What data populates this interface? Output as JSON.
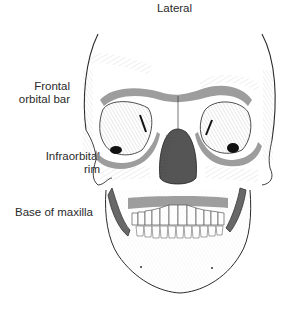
{
  "figure": {
    "title": "Lateral",
    "labels": [
      {
        "id": "frontal",
        "lines": [
          "Frontal",
          "orbital bar"
        ]
      },
      {
        "id": "infraorbital",
        "lines": [
          "Infraorbital",
          "rim"
        ]
      },
      {
        "id": "maxilla",
        "lines": [
          "Base of maxilla"
        ]
      }
    ],
    "colors": {
      "line": "#2b2b2b",
      "hatch": "#9a9a9a",
      "buttress_band": "#8c8c8c",
      "background": "#ffffff"
    }
  }
}
